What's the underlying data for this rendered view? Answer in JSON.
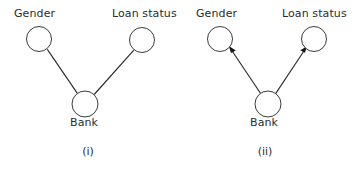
{
  "figure": {
    "background_color": "#ffffff",
    "node_stroke_color": "#3c3c3c",
    "edge_color": "#2b2b2b",
    "text_color": "#2c2c2c"
  },
  "panels": [
    {
      "caption": "(i)",
      "edge_style": "undirected",
      "nodes": [
        {
          "id": "gender",
          "label": "Gender",
          "cx": 39,
          "cy": 39,
          "r": 12.5
        },
        {
          "id": "loan",
          "label": "Loan status",
          "cx": 142,
          "cy": 40,
          "r": 12.5
        },
        {
          "id": "bank",
          "label": "Bank",
          "cx": 85,
          "cy": 104,
          "r": 13
        }
      ],
      "edges": [
        {
          "from": "bank",
          "to": "gender",
          "directed": false
        },
        {
          "from": "bank",
          "to": "loan",
          "directed": false
        }
      ]
    },
    {
      "caption": "(ii)",
      "edge_style": "directed",
      "nodes": [
        {
          "id": "gender",
          "label": "Gender",
          "cx": 40,
          "cy": 39,
          "r": 12.5
        },
        {
          "id": "loan",
          "label": "Loan status",
          "cx": 134,
          "cy": 39,
          "r": 12.5
        },
        {
          "id": "bank",
          "label": "Bank",
          "cx": 88,
          "cy": 104,
          "r": 13
        }
      ],
      "edges": [
        {
          "from": "bank",
          "to": "gender",
          "directed": true
        },
        {
          "from": "bank",
          "to": "loan",
          "directed": true
        }
      ]
    }
  ]
}
